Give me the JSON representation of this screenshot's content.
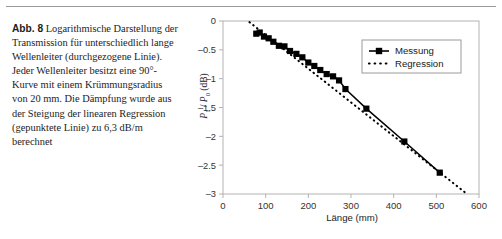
{
  "figure": {
    "label": "Abb. 8",
    "caption_text": "Logarithmische Darstellung der Transmission für unterschiedlich lange Wellenleiter (durchgezogene Linie). Jeder Wellenleiter besitzt eine 90°-Kurve mit einem Krümmungsradius von 20 mm. Die Dämpfung wurde aus der Steigung der linearen Regression (gepunktete Linie) zu 6,3 dB/m berechnet"
  },
  "chart_data": {
    "type": "line",
    "title": "",
    "xlabel": "Länge (mm)",
    "ylabel": "P1 / P0 (dB)",
    "ylabel_parts": {
      "p": "P",
      "sub1": "1",
      "slash": "/",
      "p2": "P",
      "sub0": "0",
      "unit": "(dB)"
    },
    "xlim": [
      0,
      600
    ],
    "ylim": [
      -3,
      0
    ],
    "xticks": [
      0,
      100,
      200,
      300,
      400,
      500,
      600
    ],
    "yticks": [
      0,
      -0.5,
      -1,
      -1.5,
      -2,
      -2.5,
      -3
    ],
    "xticklabels": [
      "0",
      "100",
      "200",
      "300",
      "400",
      "500",
      "600"
    ],
    "yticklabels": [
      "0",
      "-0.5",
      "-1",
      "-1.5",
      "-2",
      "-2.5",
      "-3"
    ],
    "grid": false,
    "legend_position": "upper right",
    "series": [
      {
        "name": "Messung",
        "style": "solid-with-square-markers",
        "color": "#000000",
        "x": [
          78,
          86,
          96,
          107,
          118,
          131,
          144,
          157,
          172,
          186,
          200,
          214,
          228,
          243,
          258,
          272,
          287,
          336,
          425,
          508
        ],
        "y": [
          -0.22,
          -0.2,
          -0.27,
          -0.3,
          -0.36,
          -0.43,
          -0.44,
          -0.52,
          -0.57,
          -0.63,
          -0.72,
          -0.78,
          -0.85,
          -0.92,
          -0.96,
          -1.03,
          -1.18,
          -1.52,
          -2.09,
          -2.63
        ]
      },
      {
        "name": "Regression",
        "style": "dotted",
        "color": "#000000",
        "slope_db_per_mm": -0.0063,
        "x": [
          62,
          572
        ],
        "y": [
          -0.02,
          -3.0
        ]
      }
    ],
    "legend": [
      {
        "label": "Messung",
        "marker": "square",
        "line": "solid"
      },
      {
        "label": "Regression",
        "marker": "none",
        "line": "dotted"
      }
    ],
    "annotation": {
      "attenuation": "6,3 dB/m"
    }
  }
}
